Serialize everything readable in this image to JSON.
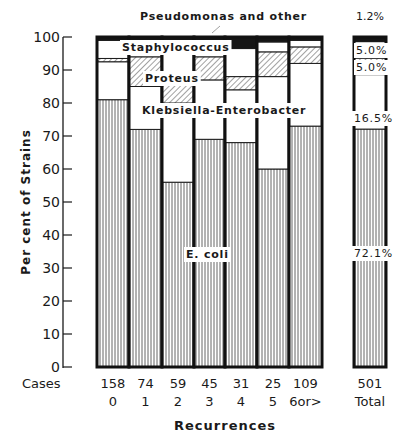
{
  "chart_data": {
    "type": "bar",
    "stacked": true,
    "title": "",
    "xlabel": "Recurrences",
    "ylabel": "Per cent of Strains",
    "ylim": [
      0,
      100
    ],
    "yticks": [
      0,
      10,
      20,
      30,
      40,
      50,
      60,
      70,
      80,
      90,
      100
    ],
    "grid": false,
    "row_label": "Cases",
    "categories": [
      "0",
      "1",
      "2",
      "3",
      "4",
      "5",
      "6or>",
      "Total"
    ],
    "cases": [
      158,
      74,
      59,
      45,
      31,
      25,
      109,
      501
    ],
    "series": [
      {
        "name": "E. coli",
        "pattern": "vertical-lines",
        "values": [
          81,
          72,
          56,
          69,
          68,
          60,
          73,
          72.1
        ]
      },
      {
        "name": "Klebsiella-Enterobacter",
        "pattern": "white",
        "values": [
          11.5,
          13,
          24,
          18,
          16,
          28,
          19,
          16.5
        ]
      },
      {
        "name": "Proteus",
        "pattern": "diagonal-hatch",
        "values": [
          1,
          9,
          9,
          7,
          4,
          7.5,
          5,
          5.0
        ]
      },
      {
        "name": "Staphylococcus",
        "pattern": "white",
        "values": [
          5.5,
          5,
          9,
          5,
          8.5,
          3,
          2,
          5.0
        ]
      },
      {
        "name": "Pseudomonas and other",
        "pattern": "solid-black",
        "values": [
          1,
          1,
          2,
          1,
          3.5,
          1.5,
          1,
          1.2
        ]
      }
    ],
    "annotations": {
      "total_labels": [
        "72.1%",
        "16.5%",
        "5.0%",
        "5.0%",
        "1.2%"
      ],
      "series_labels": [
        "E. coli",
        "Klebsiella-Enterobacter",
        "Proteus",
        "Staphylococcus",
        "Pseudomonas and other"
      ]
    }
  },
  "labels": {
    "pseudomonas": "Pseudomonas and other",
    "staph": "Staphylococcus",
    "proteus": "Proteus",
    "kleb": "Klebsiella-Enterobacter",
    "ecoli": "E. coli",
    "total_pseudo": "1.2%",
    "total_staph": "5.0%",
    "total_proteus": "5.0%",
    "total_kleb": "16.5%",
    "total_ecoli": "72.1%",
    "ylabel": "Per cent of Strains",
    "xlabel": "Recurrences",
    "cases": "Cases"
  }
}
